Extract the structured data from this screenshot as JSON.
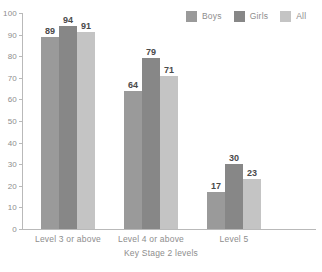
{
  "chart_data": {
    "type": "bar",
    "title": "",
    "xlabel": "Key Stage 2 levels",
    "ylabel": "",
    "ylim": [
      0,
      100
    ],
    "ytick_step": 10,
    "yticks": [
      0,
      10,
      20,
      30,
      40,
      50,
      60,
      70,
      80,
      90,
      100
    ],
    "grid": false,
    "legend_position": "top-right",
    "categories": [
      "Level 3 or above",
      "Level 4 or above",
      "Level 5"
    ],
    "series": [
      {
        "name": "Boys",
        "color": "#9a9a9a",
        "values": [
          89,
          64,
          17
        ]
      },
      {
        "name": "Girls",
        "color": "#878787",
        "values": [
          94,
          79,
          30
        ]
      },
      {
        "name": "All",
        "color": "#c4c4c4",
        "values": [
          91,
          71,
          23
        ]
      }
    ],
    "data_labels": {
      "Level 3 or above": {
        "Boys": "89",
        "Girls": "94",
        "All": "91"
      },
      "Level 4 or above": {
        "Boys": "64",
        "Girls": "79",
        "All": "71"
      },
      "Level 5": {
        "Boys": "17",
        "Girls": "30",
        "All": "23"
      }
    },
    "axis_color": "#b9b9b9",
    "tick_label_color": "#8d8d8d",
    "data_label_color": "#4a4a4a"
  },
  "legend": {
    "items": [
      {
        "label": "Boys",
        "color": "#9a9a9a"
      },
      {
        "label": "Girls",
        "color": "#878787"
      },
      {
        "label": "All",
        "color": "#c4c4c4"
      }
    ]
  },
  "axis": {
    "x_title": "Key Stage 2 levels"
  }
}
